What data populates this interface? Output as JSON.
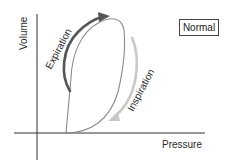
{
  "diagram": {
    "axes": {
      "x_label": "Pressure",
      "y_label": "Volume"
    },
    "legend": {
      "label": "Normal"
    },
    "arrows": [
      {
        "label": "Expiration",
        "direction": "up",
        "color": "#555555"
      },
      {
        "label": "Inspiration",
        "direction": "down",
        "color": "#c8c8c8"
      }
    ],
    "colors": {
      "axis": "#333333",
      "loop": "#8a8a8a",
      "expiration_arrow": "#555555",
      "inspiration_arrow": "#c8c8c8"
    }
  }
}
